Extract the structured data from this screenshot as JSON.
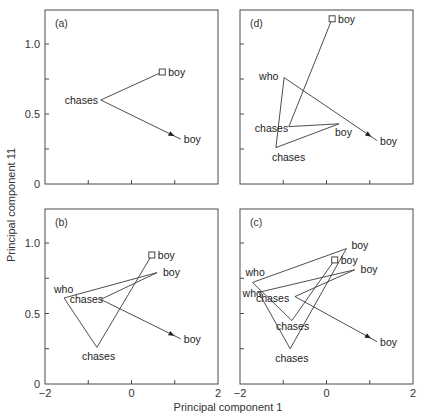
{
  "chart_data": {
    "type": "line",
    "xlabel": "Principal component 1",
    "ylabel": "Principal component 11",
    "xlim": [
      -2,
      2
    ],
    "ylim": [
      0,
      1.24
    ],
    "xticks": [
      -2,
      -1,
      0,
      1,
      2
    ],
    "xtick_labels_shown": [
      "-2",
      "0",
      "2"
    ],
    "yticks": [
      0,
      0.25,
      0.5,
      0.75,
      1.0
    ],
    "ytick_labels_shown": [
      "0",
      "0.5",
      "1.0"
    ],
    "grid": false,
    "legend": null,
    "markers": {
      "start": "open-square",
      "end": "arrowhead"
    },
    "panels": [
      {
        "id": "a",
        "label": "(a)",
        "position": "top-left",
        "points": [
          {
            "word": "boy",
            "x": 0.71,
            "y": 0.8,
            "label_dx": 6,
            "label_dy": 4
          },
          {
            "word": "chases",
            "x": -0.71,
            "y": 0.6,
            "label_dx": -36,
            "label_dy": 4
          },
          {
            "word": "boy",
            "x": 1.14,
            "y": 0.32,
            "label_dx": 3,
            "label_dy": 4
          }
        ]
      },
      {
        "id": "d",
        "label": "(d)",
        "position": "top-right",
        "points": [
          {
            "word": "boy",
            "x": 0.13,
            "y": 1.18,
            "label_dx": 6,
            "label_dy": 4
          },
          {
            "word": "chases",
            "x": -0.87,
            "y": 0.41,
            "label_dx": -34,
            "label_dy": 5
          },
          {
            "word": "boy",
            "x": 0.29,
            "y": 0.43,
            "label_dx": -4,
            "label_dy": 12
          },
          {
            "word": "chases",
            "x": -1.17,
            "y": 0.26,
            "label_dx": -4,
            "label_dy": 13
          },
          {
            "word": "who",
            "x": -0.98,
            "y": 0.76,
            "label_dx": -25,
            "label_dy": 2
          },
          {
            "word": "boy",
            "x": 1.17,
            "y": 0.31,
            "label_dx": 3,
            "label_dy": 4
          }
        ]
      },
      {
        "id": "b",
        "label": "(b)",
        "position": "bottom-left",
        "points": [
          {
            "word": "boy",
            "x": 0.47,
            "y": 0.915,
            "label_dx": 6,
            "label_dy": 4
          },
          {
            "word": "chases",
            "x": -0.8,
            "y": 0.26,
            "label_dx": -15,
            "label_dy": 13
          },
          {
            "word": "who",
            "x": -1.56,
            "y": 0.61,
            "label_dx": -10,
            "label_dy": -5
          },
          {
            "word": "boy",
            "x": 0.59,
            "y": 0.79,
            "label_dx": 6,
            "label_dy": 3
          },
          {
            "word": "chases",
            "x": -0.71,
            "y": 0.6,
            "label_dx": -31,
            "label_dy": 4
          },
          {
            "word": "boy",
            "x": 1.14,
            "y": 0.32,
            "label_dx": 3,
            "label_dy": 4
          }
        ]
      },
      {
        "id": "c",
        "label": "(c)",
        "position": "bottom-right",
        "points": [
          {
            "word": "boy",
            "x": 0.19,
            "y": 0.88,
            "label_dx": 6,
            "label_dy": 4
          },
          {
            "word": "chases",
            "x": -0.8,
            "y": 0.45,
            "label_dx": -16,
            "label_dy": 9
          },
          {
            "word": "who",
            "x": -1.71,
            "y": 0.72,
            "label_dx": -7,
            "label_dy": -6
          },
          {
            "word": "boy",
            "x": 0.46,
            "y": 0.96,
            "label_dx": 5,
            "label_dy": 0
          },
          {
            "word": "chases",
            "x": -0.84,
            "y": 0.25,
            "label_dx": -15,
            "label_dy": 13
          },
          {
            "word": "who",
            "x": -1.57,
            "y": 0.65,
            "label_dx": -16,
            "label_dy": 5
          },
          {
            "word": "boy",
            "x": 0.65,
            "y": 0.81,
            "label_dx": 6,
            "label_dy": 3
          },
          {
            "word": "chases",
            "x": -0.73,
            "y": 0.62,
            "label_dx": -39,
            "label_dy": 5
          },
          {
            "word": "boy",
            "x": 1.17,
            "y": 0.3,
            "label_dx": 3,
            "label_dy": 4
          }
        ]
      }
    ]
  },
  "axes": {
    "x_tick_labels": [
      "-2",
      "0",
      "2"
    ],
    "y_tick_labels": [
      "0",
      "0.5",
      "1.0"
    ]
  },
  "colors": {
    "line": "#3a3a3a",
    "frame": "#4a4a4a",
    "text": "#222222",
    "background": "#ffffff"
  }
}
